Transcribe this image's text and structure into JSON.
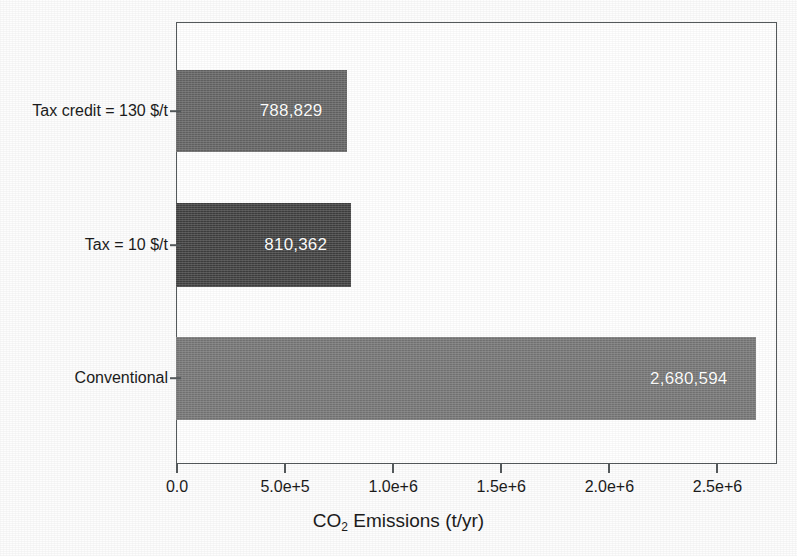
{
  "chart_data": {
    "type": "bar",
    "orientation": "horizontal",
    "title": "",
    "xlabel": "CO2 Emissions (t/yr)",
    "xlabel_parts": {
      "pre": "CO",
      "sub": "2",
      "post": " Emissions (t/yr)"
    },
    "ylabel": "",
    "categories": [
      "Tax credit = 130 $/t",
      "Tax = 10 $/t",
      "Conventional"
    ],
    "values": [
      788829,
      810362,
      2680594
    ],
    "data_labels": [
      "788,829",
      "810,362",
      "2,680,594"
    ],
    "xlim": [
      0,
      2780000
    ],
    "xticks": [
      0,
      500000,
      1000000,
      1500000,
      2000000,
      2500000
    ],
    "xtick_labels": [
      "0.0",
      "5.0e+5",
      "1.0e+6",
      "1.5e+6",
      "2.0e+6",
      "2.5e+6"
    ],
    "grid": false,
    "legend": false,
    "bar_colors": [
      "#6a6a6a",
      "#454545",
      "#7d7d7d"
    ],
    "data_label_color": "#ffffff",
    "axis_color": "#555a5c"
  }
}
